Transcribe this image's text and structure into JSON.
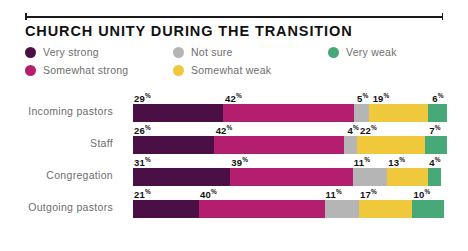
{
  "chart_data": {
    "type": "bar",
    "subtype": "stacked-horizontal-100",
    "title": "CHURCH UNITY DURING THE TRANSITION",
    "xlabel": "",
    "ylabel": "",
    "xlim": [
      0,
      100
    ],
    "grid": false,
    "legend_position": "top",
    "value_suffix": "%",
    "categories": [
      "Incoming pastors",
      "Staff",
      "Congregation",
      "Outgoing pastors"
    ],
    "series": [
      {
        "name": "Very strong",
        "color": "#4a1046",
        "values": [
          29,
          26,
          31,
          21
        ]
      },
      {
        "name": "Somewhat strong",
        "color": "#b41e6e",
        "values": [
          42,
          42,
          39,
          40
        ]
      },
      {
        "name": "Not sure",
        "color": "#b5b5b5",
        "values": [
          5,
          4,
          11,
          11
        ]
      },
      {
        "name": "Somewhat weak",
        "color": "#f0c83c",
        "values": [
          19,
          22,
          13,
          17
        ]
      },
      {
        "name": "Very weak",
        "color": "#47a878",
        "values": [
          6,
          7,
          4,
          10
        ]
      }
    ]
  },
  "legend": {
    "items": [
      {
        "label": "Very strong",
        "color": "#4a1046",
        "col": 0,
        "row": 0
      },
      {
        "label": "Somewhat strong",
        "color": "#b41e6e",
        "col": 0,
        "row": 1
      },
      {
        "label": "Not sure",
        "color": "#b5b5b5",
        "col": 1,
        "row": 0
      },
      {
        "label": "Somewhat weak",
        "color": "#f0c83c",
        "col": 1,
        "row": 1
      },
      {
        "label": "Very weak",
        "color": "#47a878",
        "col": 2,
        "row": 0
      }
    ]
  },
  "colors": {
    "background": "#ffffff",
    "title": "#111111",
    "label": "#6e6e6e",
    "value": "#111111",
    "rule": "#1a1a1a"
  }
}
